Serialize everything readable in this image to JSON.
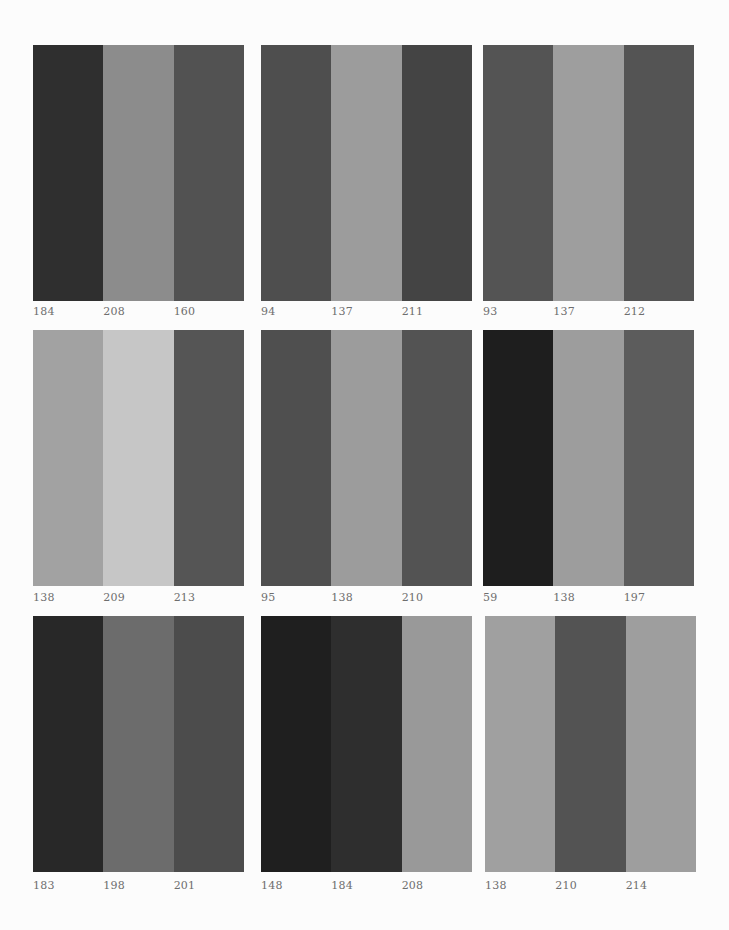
{
  "panels": [
    {
      "stripes": [
        {
          "label": "184",
          "color": "#2f2f2f"
        },
        {
          "label": "208",
          "color": "#8c8c8c"
        },
        {
          "label": "160",
          "color": "#525252"
        }
      ]
    },
    {
      "stripes": [
        {
          "label": "94",
          "color": "#4e4e4e"
        },
        {
          "label": "137",
          "color": "#9c9c9c"
        },
        {
          "label": "211",
          "color": "#444444"
        }
      ]
    },
    {
      "stripes": [
        {
          "label": "93",
          "color": "#545454"
        },
        {
          "label": "137",
          "color": "#9e9e9e"
        },
        {
          "label": "212",
          "color": "#545454"
        }
      ]
    },
    {
      "stripes": [
        {
          "label": "138",
          "color": "#a2a2a2"
        },
        {
          "label": "209",
          "color": "#c6c6c6"
        },
        {
          "label": "213",
          "color": "#555555"
        }
      ]
    },
    {
      "stripes": [
        {
          "label": "95",
          "color": "#4f4f4f"
        },
        {
          "label": "138",
          "color": "#9c9c9c"
        },
        {
          "label": "210",
          "color": "#535353"
        }
      ]
    },
    {
      "stripes": [
        {
          "label": "59",
          "color": "#1e1e1e"
        },
        {
          "label": "138",
          "color": "#9d9d9d"
        },
        {
          "label": "197",
          "color": "#5c5c5c"
        }
      ]
    },
    {
      "stripes": [
        {
          "label": "183",
          "color": "#282828"
        },
        {
          "label": "198",
          "color": "#6c6c6c"
        },
        {
          "label": "201",
          "color": "#4c4c4c"
        }
      ]
    },
    {
      "stripes": [
        {
          "label": "148",
          "color": "#1f1f1f"
        },
        {
          "label": "184",
          "color": "#2e2e2e"
        },
        {
          "label": "208",
          "color": "#999999"
        }
      ]
    },
    {
      "stripes": [
        {
          "label": "138",
          "color": "#a0a0a0"
        },
        {
          "label": "210",
          "color": "#535353"
        },
        {
          "label": "214",
          "color": "#9e9e9e"
        }
      ]
    }
  ]
}
